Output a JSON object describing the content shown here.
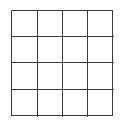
{
  "grid": {
    "rows": 4,
    "cols": 4,
    "line_color": "#3a3a3a",
    "background": "#ffffff",
    "cells": [
      [
        "",
        "",
        "",
        ""
      ],
      [
        "",
        "",
        "",
        ""
      ],
      [
        "",
        "",
        "",
        ""
      ],
      [
        "",
        "",
        "",
        ""
      ]
    ]
  }
}
